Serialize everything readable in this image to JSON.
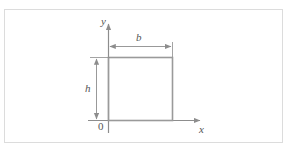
{
  "figure": {
    "type": "engineering-cross-section-diagram",
    "labels": {
      "y_axis": "y",
      "x_axis": "x",
      "width_dimension": "b",
      "height_dimension": "h",
      "origin": "0"
    },
    "colors": {
      "frame_border": "#dcdcdc",
      "axis_line": "#8d8d8d",
      "shape_outline": "#9a9a9a",
      "dimension_line": "#8d8d8d",
      "label_text": "#555555",
      "background": "#ffffff"
    },
    "geometry": {
      "rectangle": {
        "left": 108,
        "top": 57,
        "right": 172,
        "bottom": 120
      },
      "y_axis": {
        "x": 108,
        "top": 22,
        "bottom": 133
      },
      "x_axis": {
        "y": 120,
        "left": 88,
        "right": 203
      },
      "width_dimension_line": {
        "y": 46,
        "from_x": 108,
        "to_x": 172
      },
      "height_dimension_line": {
        "x": 96,
        "from_y": 57,
        "to_y": 120
      }
    }
  }
}
